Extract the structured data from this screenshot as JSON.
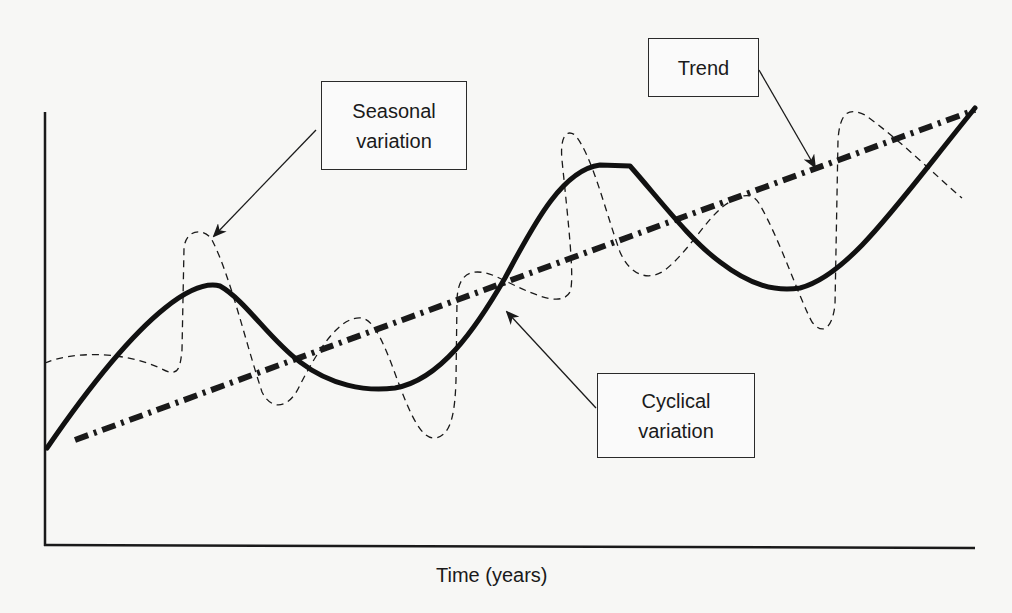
{
  "diagram": {
    "x_axis_label": "Time (years)",
    "labels": {
      "seasonal": {
        "line1": "Seasonal",
        "line2": "variation"
      },
      "trend": {
        "line1": "Trend"
      },
      "cyclical": {
        "line1": "Cyclical",
        "line2": "variation"
      }
    },
    "colors": {
      "background": "#f7f7f5",
      "ink": "#1a1a1a"
    },
    "series": [
      {
        "name": "Trend",
        "style": "thick dash-dot straight line",
        "from": [
          75,
          440
        ],
        "to": [
          975,
          112
        ]
      },
      {
        "name": "Cyclical variation",
        "style": "thick solid wave"
      },
      {
        "name": "Seasonal variation",
        "style": "thin dashed oscillation"
      }
    ]
  }
}
